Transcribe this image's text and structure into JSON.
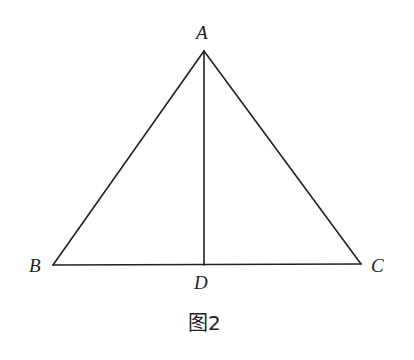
{
  "diagram": {
    "type": "geometry-triangle",
    "points": {
      "A": {
        "label": "A",
        "x": 204,
        "y": 51
      },
      "B": {
        "label": "B",
        "x": 53,
        "y": 265
      },
      "C": {
        "label": "C",
        "x": 361,
        "y": 264
      },
      "D": {
        "label": "D",
        "x": 204,
        "y": 265
      }
    },
    "segments": [
      {
        "from": "A",
        "to": "B"
      },
      {
        "from": "A",
        "to": "C"
      },
      {
        "from": "B",
        "to": "C"
      },
      {
        "from": "A",
        "to": "D"
      }
    ],
    "caption": "图2",
    "colors": {
      "stroke": "#222222",
      "background": "#ffffff"
    }
  }
}
